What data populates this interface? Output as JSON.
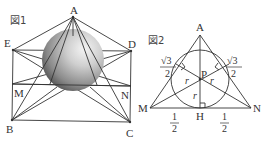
{
  "figure1": {
    "title": "図1",
    "labels": {
      "A": "A",
      "E": "E",
      "D": "D",
      "M": "M",
      "N": "N",
      "B": "B",
      "C": "C"
    },
    "points": {
      "A": [
        73,
        17
      ],
      "E": [
        13,
        50
      ],
      "D": [
        131,
        51
      ],
      "M": [
        12,
        84
      ],
      "N": [
        131,
        86
      ],
      "B": [
        12,
        120
      ],
      "C": [
        130,
        122
      ]
    },
    "sphere": {
      "center": [
        73,
        60
      ],
      "radius": 31
    }
  },
  "figure2": {
    "title": "図2",
    "labels": {
      "A": "A",
      "M": "M",
      "N": "N",
      "P": "P",
      "H": "H",
      "r": "r"
    },
    "points": {
      "A": [
        200,
        35
      ],
      "M": [
        150,
        108
      ],
      "N": [
        251,
        108
      ],
      "H": [
        200,
        108
      ],
      "P": [
        200,
        79
      ]
    },
    "incircle": {
      "center": [
        200,
        79
      ],
      "radius": 29
    },
    "segment_labels": {
      "left_upper": {
        "num": "√3",
        "den": "2"
      },
      "right_upper": {
        "num": "√3",
        "den": "2"
      },
      "left_lower": {
        "num": "1",
        "den": "2"
      },
      "right_lower": {
        "num": "1",
        "den": "2"
      }
    }
  }
}
